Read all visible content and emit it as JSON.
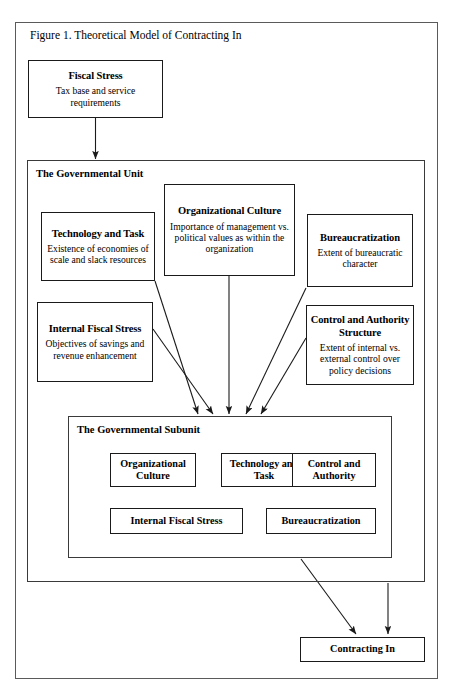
{
  "figure": {
    "caption": "Figure 1. Theoretical Model of Contracting In"
  },
  "nodes": {
    "fiscal_stress": {
      "title": "Fiscal Stress",
      "body": "Tax base and service requirements"
    },
    "governmental_unit": {
      "title": "The Governmental Unit"
    },
    "technology_and_task": {
      "title": "Technology and Task",
      "body": "Existence of economies of scale and slack resources"
    },
    "organizational_culture": {
      "title": "Organizational Culture",
      "body": "Importance of management vs. political values as within the organization"
    },
    "bureaucratization": {
      "title": "Bureaucratization",
      "body": "Extent of bureaucratic character"
    },
    "internal_fiscal_stress": {
      "title": "Internal Fiscal Stress",
      "body": "Objectives of savings and revenue enhancement"
    },
    "control_and_authority_structure": {
      "title": "Control and Authority Structure",
      "body": "Extent of internal vs. external control over policy decisions"
    },
    "governmental_subunit": {
      "title": "The Governmental Subunit"
    },
    "subunit_items": [
      {
        "label": "Organizational Culture"
      },
      {
        "label": "Technology and Task"
      },
      {
        "label": "Control and Authority"
      },
      {
        "label": "Internal Fiscal Stress"
      },
      {
        "label": "Bureaucratization"
      }
    ],
    "contracting_in": {
      "title": "Contracting In"
    }
  },
  "colors": {
    "stroke": "#1a1a1a",
    "container_stroke": "#3a3a3a",
    "frame_stroke": "#5a5a5a",
    "background": "#ffffff",
    "text": "#000000"
  }
}
